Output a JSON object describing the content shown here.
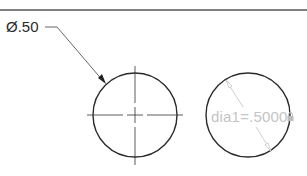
{
  "canvas": {
    "background": "#ffffff",
    "line_color": "#2a2a2a",
    "dim_color": "#c4c4c4"
  },
  "annotations": {
    "diameter_dimension": "Ø.50",
    "parametric_dimension": "dia1=.5000"
  },
  "icons": {
    "lock": "lock-icon"
  }
}
